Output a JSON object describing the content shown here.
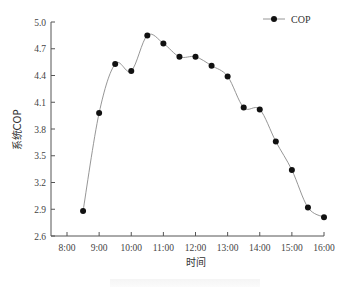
{
  "chart_data": {
    "type": "line",
    "title": "",
    "xlabel": "时间",
    "ylabel": "系统COP",
    "x_tick_labels": [
      "8:00",
      "9:00",
      "10:00",
      "11:00",
      "12:00",
      "13:00",
      "14:00",
      "15:00",
      "16:00"
    ],
    "y_tick_labels": [
      "2.6",
      "2.9",
      "3.2",
      "3.5",
      "3.8",
      "4.1",
      "4.4",
      "4.7",
      "5.0"
    ],
    "ylim": [
      2.6,
      5.0
    ],
    "xlim_hours": [
      8.0,
      16.0
    ],
    "grid": false,
    "legend_position": "top-right",
    "series": [
      {
        "name": "COP",
        "marker": "filled-circle",
        "line": "smoothed",
        "x": [
          "8:30",
          "9:00",
          "9:30",
          "10:00",
          "10:30",
          "11:00",
          "11:30",
          "12:00",
          "12:30",
          "13:00",
          "13:30",
          "14:00",
          "14:30",
          "15:00",
          "15:30",
          "16:00"
        ],
        "x_hours": [
          8.5,
          9.0,
          9.5,
          10.0,
          10.5,
          11.0,
          11.5,
          12.0,
          12.5,
          13.0,
          13.5,
          14.0,
          14.5,
          15.0,
          15.5,
          16.0
        ],
        "values": [
          2.88,
          3.98,
          4.53,
          4.45,
          4.85,
          4.76,
          4.61,
          4.61,
          4.51,
          4.39,
          4.04,
          4.02,
          3.66,
          3.34,
          2.92,
          2.81
        ]
      }
    ]
  },
  "legend": {
    "label": "COP"
  },
  "colors": {
    "line": "#8a8a8a",
    "marker": "#111111",
    "axis": "#555555"
  }
}
